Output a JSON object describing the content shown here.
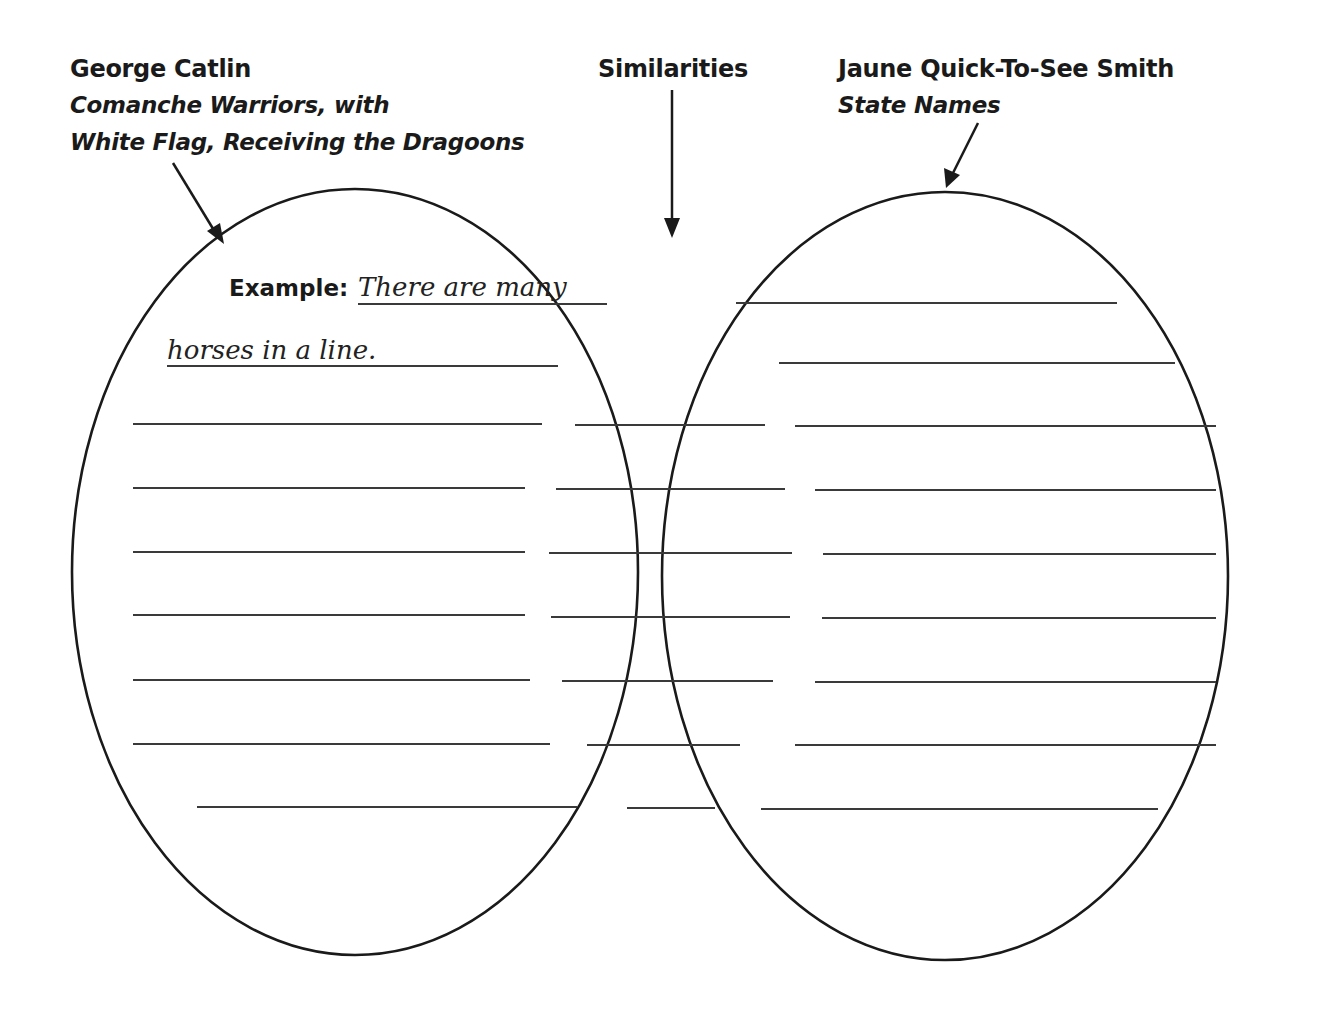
{
  "left_header": {
    "artist": "George Catlin",
    "title_line1": "Comanche Warriors, with",
    "title_line2": "White Flag, Receiving the Dragoons"
  },
  "center_header": {
    "label": "Similarities"
  },
  "right_header": {
    "artist": "Jaune Quick-To-See Smith",
    "title": "State Names"
  },
  "example": {
    "label": "Example:",
    "line1": "There are many",
    "line2": "horses in a line."
  },
  "colors": {
    "stroke": "#1a1a1a",
    "background": "#ffffff"
  },
  "writing_lines": {
    "left_count": 9,
    "center_count": 7,
    "right_count": 9
  }
}
